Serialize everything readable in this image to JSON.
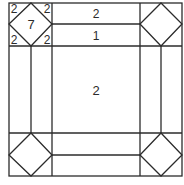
{
  "diagram": {
    "stroke_color": "#2b2b2b",
    "background": "#ffffff",
    "labels": {
      "corner_tl_tri_tl": "2",
      "corner_tl_tri_tr": "2",
      "corner_tl_tri_bl": "2",
      "corner_tl_tri_br": "2",
      "corner_tl_center": "7",
      "top_strip_outer": "2",
      "top_strip_inner": "1",
      "center": "2"
    }
  }
}
